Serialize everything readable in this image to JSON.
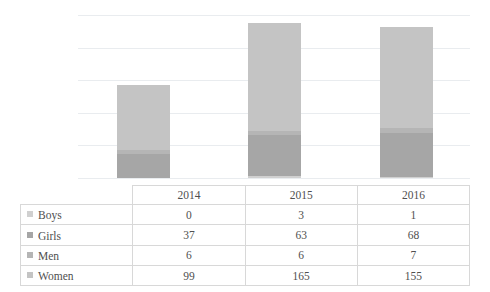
{
  "chart_data": {
    "type": "bar",
    "subtype": "stacked-column",
    "title": "",
    "xlabel": "",
    "ylabel": "",
    "categories": [
      "2014",
      "2015",
      "2016"
    ],
    "series": [
      {
        "name": "Boys",
        "values": [
          0,
          3,
          1
        ],
        "color": "#d0d0d0"
      },
      {
        "name": "Girls",
        "values": [
          37,
          63,
          68
        ],
        "color": "#a6a6a6"
      },
      {
        "name": "Men",
        "values": [
          6,
          6,
          7
        ],
        "color": "#b5b5b5"
      },
      {
        "name": "Women",
        "values": [
          99,
          165,
          155
        ],
        "color": "#c4c4c4"
      }
    ],
    "totals": [
      142,
      237,
      231
    ],
    "ylim": [
      0,
      250
    ],
    "gridlines": [
      0,
      50,
      100,
      150,
      200,
      250
    ],
    "grid": true,
    "legend_position": "table-row-labels",
    "axis_labels_visible": false
  },
  "table": {
    "corner_label": "",
    "column_headers": [
      "2014",
      "2015",
      "2016"
    ],
    "rows": [
      {
        "label": "Boys",
        "swatch_color": "#d0d0d0",
        "values": [
          "0",
          "3",
          "1"
        ]
      },
      {
        "label": "Girls",
        "swatch_color": "#a6a6a6",
        "values": [
          "37",
          "63",
          "68"
        ]
      },
      {
        "label": "Men",
        "swatch_color": "#b5b5b5",
        "values": [
          "6",
          "6",
          "7"
        ]
      },
      {
        "label": "Women",
        "swatch_color": "#c4c4c4",
        "values": [
          "99",
          "165",
          "155"
        ]
      }
    ]
  },
  "style": {
    "gridline_color": "#e9ecef",
    "table_border_color": "#d8d8d8",
    "background": "#ffffff",
    "text_color": "#4f4f4f"
  }
}
